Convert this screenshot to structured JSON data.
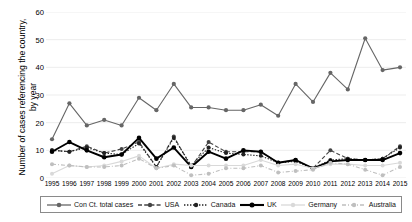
{
  "chart_data": {
    "type": "line",
    "title": "",
    "xlabel": "",
    "ylabel": "Number of cases referencing the country,\nby year",
    "ylim": [
      0,
      60
    ],
    "yticks": [
      0,
      10,
      20,
      30,
      40,
      50,
      60
    ],
    "grid": true,
    "legend_position": "bottom",
    "categories": [
      "1995",
      "1996",
      "1997",
      "1998",
      "1999",
      "2000",
      "2001",
      "2002",
      "2003",
      "2004",
      "2005",
      "2006",
      "2007",
      "2008",
      "2009",
      "2010",
      "2011",
      "2012",
      "2013",
      "2014",
      "2015"
    ],
    "series": [
      {
        "name": "Con Ct. total cases",
        "color": "#666666",
        "style": "solid",
        "values": [
          14,
          27,
          19,
          21,
          19,
          29,
          24.5,
          34,
          25.5,
          25.5,
          24.5,
          24.5,
          26.5,
          22.5,
          34,
          27.5,
          38,
          32,
          50.5,
          39,
          40
        ]
      },
      {
        "name": "USA",
        "color": "#444444",
        "style": "dashed",
        "values": [
          10,
          9.5,
          11.5,
          9,
          10.5,
          13,
          4,
          15,
          4,
          13,
          9.5,
          9.5,
          9.5,
          5.5,
          6.5,
          3.5,
          10,
          7,
          6.5,
          7,
          11.5
        ]
      },
      {
        "name": "Canada",
        "color": "#222222",
        "style": "dotted",
        "values": [
          10,
          9.5,
          11,
          9,
          8.5,
          12.5,
          4,
          14.5,
          4.5,
          11,
          9,
          8.5,
          8,
          5.5,
          6,
          3.5,
          6.5,
          7,
          6.5,
          7,
          11
        ]
      },
      {
        "name": "UK",
        "color": "#000000",
        "style": "solid-bold",
        "values": [
          9.5,
          13,
          10,
          7.5,
          8.5,
          14.5,
          7,
          11,
          4,
          9.5,
          7,
          10,
          9.5,
          5.5,
          6.5,
          3.5,
          6,
          6.5,
          6.5,
          6.5,
          9
        ]
      },
      {
        "name": "Germany",
        "color": "#d9d9d9",
        "style": "solid-light",
        "values": [
          1.5,
          4.5,
          4,
          4.5,
          6,
          8,
          3.5,
          5,
          4.5,
          4.5,
          4.5,
          4.5,
          6.5,
          4.5,
          5,
          3.5,
          5,
          5,
          4.5,
          4.5,
          5.5
        ]
      },
      {
        "name": "Australia",
        "color": "#bfbfbf",
        "style": "dashdot-light",
        "values": [
          5,
          4.5,
          4,
          4,
          4.5,
          7,
          3.5,
          4.5,
          1,
          1.5,
          3.5,
          3.5,
          4.5,
          2,
          2.5,
          3,
          5.5,
          5,
          3,
          1,
          4
        ]
      }
    ]
  },
  "axis": {
    "y_tick_labels": [
      "0",
      "10",
      "20",
      "30",
      "40",
      "50",
      "60"
    ],
    "y_title": "Number of cases referencing the country,\nby year"
  },
  "legend": {
    "items": [
      {
        "label": "Con Ct. total cases"
      },
      {
        "label": "USA"
      },
      {
        "label": "Canada"
      },
      {
        "label": "UK"
      },
      {
        "label": "Germany"
      },
      {
        "label": "Australia"
      }
    ]
  }
}
